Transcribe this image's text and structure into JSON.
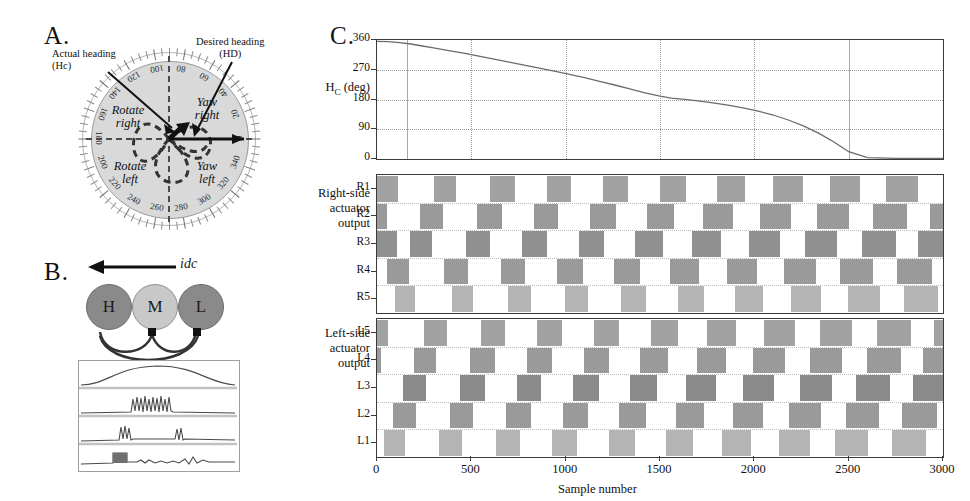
{
  "figure": {
    "panels": [
      {
        "id": "A",
        "letter": "A."
      },
      {
        "id": "B",
        "letter": "B."
      },
      {
        "id": "C",
        "letter": "C."
      }
    ]
  },
  "panel_a": {
    "letter": "A.",
    "annotations": {
      "actual_heading_line1": "Actual heading",
      "actual_heading_line2": "(Hc)",
      "desired_heading_line1": "Desired heading",
      "desired_heading_line2": "(HD)"
    },
    "quadrants": [
      {
        "name": "rotate-right",
        "line1": "Rotate",
        "line2": "right"
      },
      {
        "name": "yaw-right",
        "line1": "Yaw",
        "line2": "right"
      },
      {
        "name": "rotate-left",
        "line1": "Rotate",
        "line2": "left"
      },
      {
        "name": "yaw-left",
        "line1": "Yaw",
        "line2": "left"
      }
    ],
    "tick_labels": [
      0,
      20,
      40,
      60,
      80,
      100,
      120,
      140,
      160,
      180,
      200,
      220,
      240,
      260,
      280,
      300,
      320,
      340
    ],
    "disc_color": "#d9d9d9",
    "dashed_color": "#4a4a4a"
  },
  "panel_b": {
    "letter": "B.",
    "current_label": "idc",
    "nodes": [
      {
        "label": "H",
        "shade": "dark"
      },
      {
        "label": "M",
        "shade": "light"
      },
      {
        "label": "L",
        "shade": "dark"
      }
    ],
    "trace_count": 4
  },
  "panel_c": {
    "letter": "C.",
    "axis_titles": {
      "heading": "Hc (deg)",
      "heading_main": "H",
      "heading_sub": "C",
      "heading_unit": " (deg)",
      "right_side_l1": "Right-side",
      "right_side_l2": "actuator",
      "right_side_l3": "output",
      "left_side_l1": "Left-side",
      "left_side_l2": "actuator",
      "left_side_l3": "output",
      "xlabel": "Sample number"
    },
    "x_ticks": [
      0,
      500,
      1000,
      1500,
      2000,
      2500,
      3000
    ],
    "right_rows": [
      "R1",
      "R2",
      "R3",
      "R4",
      "R5"
    ],
    "left_rows": [
      "L5",
      "L4",
      "L3",
      "L2",
      "L1"
    ]
  },
  "chart_data": [
    {
      "name": "heading-plot",
      "type": "line",
      "title": "",
      "xlabel": "Sample number",
      "ylabel": "Hc (deg)",
      "xlim": [
        0,
        3000
      ],
      "ylim": [
        0,
        360
      ],
      "y_ticks": [
        0,
        90,
        180,
        270,
        360
      ],
      "x_ticks": [
        0,
        500,
        1000,
        1500,
        2000,
        2500,
        3000
      ],
      "grid": true,
      "series": [
        {
          "name": "Actual heading Hc",
          "x": [
            0,
            60,
            120,
            180,
            240,
            300,
            380,
            460,
            540,
            620,
            700,
            780,
            860,
            940,
            1020,
            1100,
            1180,
            1260,
            1340,
            1420,
            1500,
            1560,
            1620,
            1700,
            1780,
            1860,
            1940,
            2020,
            2100,
            2180,
            2260,
            2340,
            2420,
            2500,
            2600,
            2750,
            3000
          ],
          "y": [
            356,
            355,
            352,
            348,
            342,
            336,
            328,
            320,
            311,
            302,
            293,
            284,
            275,
            266,
            256,
            246,
            235,
            224,
            212,
            200,
            190,
            184,
            181,
            176,
            170,
            163,
            155,
            145,
            133,
            118,
            100,
            78,
            52,
            22,
            4,
            2,
            2
          ]
        }
      ]
    },
    {
      "name": "right-actuator-raster",
      "type": "heatmap",
      "xlabel": "Sample number",
      "ylabel": "Right-side actuator output",
      "xlim": [
        0,
        3000
      ],
      "rows": [
        "R1",
        "R2",
        "R3",
        "R4",
        "R5"
      ],
      "burst_period": 300,
      "note": "Staggered phase bands; each row fires in sequence producing a travelling wave",
      "row_bursts": [
        {
          "row": "R1",
          "shade": "#a2a2a2",
          "bursts": [
            [
              0,
              110
            ],
            [
              300,
              420
            ],
            [
              600,
              730
            ],
            [
              900,
              1030
            ],
            [
              1200,
              1330
            ],
            [
              1500,
              1640
            ],
            [
              1800,
              1950
            ],
            [
              2100,
              2260
            ],
            [
              2400,
              2560
            ],
            [
              2700,
              2870
            ]
          ]
        },
        {
          "row": "R2",
          "shade": "#9a9a9a",
          "bursts": [
            [
              0,
              55
            ],
            [
              230,
              350
            ],
            [
              530,
              660
            ],
            [
              830,
              960
            ],
            [
              1130,
              1265
            ],
            [
              1430,
              1575
            ],
            [
              1730,
              1885
            ],
            [
              2030,
              2195
            ],
            [
              2330,
              2500
            ],
            [
              2630,
              2810
            ],
            [
              2930,
              3000
            ]
          ]
        },
        {
          "row": "R3",
          "shade": "#909090",
          "bursts": [
            [
              0,
              105
            ],
            [
              175,
              290
            ],
            [
              470,
              600
            ],
            [
              770,
              900
            ],
            [
              1070,
              1205
            ],
            [
              1370,
              1515
            ],
            [
              1670,
              1825
            ],
            [
              1970,
              2135
            ],
            [
              2270,
              2440
            ],
            [
              2570,
              2750
            ],
            [
              2870,
              3000
            ]
          ]
        },
        {
          "row": "R4",
          "shade": "#9a9a9a",
          "bursts": [
            [
              55,
              170
            ],
            [
              355,
              480
            ],
            [
              655,
              785
            ],
            [
              955,
              1090
            ],
            [
              1255,
              1395
            ],
            [
              1555,
              1705
            ],
            [
              1855,
              2015
            ],
            [
              2155,
              2325
            ],
            [
              2455,
              2630
            ],
            [
              2755,
              2940
            ]
          ]
        },
        {
          "row": "R5",
          "shade": "#b4b4b4",
          "bursts": [
            [
              95,
              200
            ],
            [
              395,
              510
            ],
            [
              695,
              815
            ],
            [
              995,
              1120
            ],
            [
              1295,
              1425
            ],
            [
              1595,
              1735
            ],
            [
              1895,
              2045
            ],
            [
              2195,
              2355
            ],
            [
              2495,
              2665
            ],
            [
              2795,
              2975
            ]
          ]
        }
      ]
    },
    {
      "name": "left-actuator-raster",
      "type": "heatmap",
      "xlabel": "Sample number",
      "ylabel": "Left-side actuator output",
      "xlim": [
        0,
        3000
      ],
      "rows": [
        "L5",
        "L4",
        "L3",
        "L2",
        "L1"
      ],
      "burst_period": 300,
      "note": "Staggered phase bands mirroring the right-side pattern",
      "row_bursts": [
        {
          "row": "L5",
          "shade": "#a2a2a2",
          "bursts": [
            [
              0,
              60
            ],
            [
              250,
              370
            ],
            [
              550,
              680
            ],
            [
              850,
              980
            ],
            [
              1150,
              1285
            ],
            [
              1450,
              1595
            ],
            [
              1750,
              1905
            ],
            [
              2050,
              2215
            ],
            [
              2350,
              2520
            ],
            [
              2650,
              2830
            ],
            [
              2950,
              3000
            ]
          ]
        },
        {
          "row": "L4",
          "shade": "#9a9a9a",
          "bursts": [
            [
              0,
              20
            ],
            [
              195,
              315
            ],
            [
              495,
              625
            ],
            [
              795,
              925
            ],
            [
              1095,
              1230
            ],
            [
              1395,
              1540
            ],
            [
              1695,
              1850
            ],
            [
              1995,
              2160
            ],
            [
              2295,
              2465
            ],
            [
              2595,
              2775
            ],
            [
              2895,
              3000
            ]
          ]
        },
        {
          "row": "L3",
          "shade": "#8a8a8a",
          "bursts": [
            [
              140,
              260
            ],
            [
              440,
              570
            ],
            [
              740,
              870
            ],
            [
              1040,
              1175
            ],
            [
              1340,
              1485
            ],
            [
              1640,
              1795
            ],
            [
              1940,
              2105
            ],
            [
              2240,
              2410
            ],
            [
              2540,
              2720
            ],
            [
              2840,
              3000
            ]
          ]
        },
        {
          "row": "L2",
          "shade": "#9a9a9a",
          "bursts": [
            [
              85,
              205
            ],
            [
              385,
              510
            ],
            [
              685,
              815
            ],
            [
              985,
              1120
            ],
            [
              1285,
              1425
            ],
            [
              1585,
              1735
            ],
            [
              1885,
              2045
            ],
            [
              2185,
              2355
            ],
            [
              2485,
              2660
            ],
            [
              2785,
              2970
            ]
          ]
        },
        {
          "row": "L1",
          "shade": "#b4b4b4",
          "bursts": [
            [
              35,
              150
            ],
            [
              330,
              450
            ],
            [
              630,
              760
            ],
            [
              930,
              1060
            ],
            [
              1230,
              1365
            ],
            [
              1530,
              1675
            ],
            [
              1830,
              1985
            ],
            [
              2130,
              2295
            ],
            [
              2430,
              2600
            ],
            [
              2730,
              2910
            ]
          ]
        }
      ]
    }
  ]
}
